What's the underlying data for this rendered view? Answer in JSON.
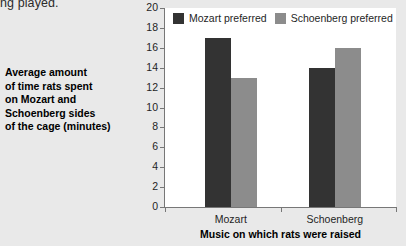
{
  "clipped_text": "ng played.",
  "y_caption_lines": [
    "Average amount",
    "of time rats spent",
    "on Mozart and",
    "Schoenberg sides",
    "of the cage (minutes)"
  ],
  "colors": {
    "series_mozart": "#333333",
    "series_schoenberg": "#8c8c8c",
    "page_background": "#e9e9e9",
    "plot_background": "#ffffff",
    "axis": "#777777"
  },
  "chart_data": {
    "type": "bar",
    "title": "",
    "xlabel": "Music on which rats were raised",
    "ylabel": "Average amount of time rats spent on Mozart and Schoenberg sides of the cage (minutes)",
    "categories": [
      "Mozart",
      "Schoenberg"
    ],
    "series": [
      {
        "name": "Mozart preferred",
        "values": [
          17,
          14
        ]
      },
      {
        "name": "Schoenberg preferred",
        "values": [
          13,
          16
        ]
      }
    ],
    "ylim": [
      0,
      20
    ],
    "ytick_step": 2,
    "yticks": [
      0,
      2,
      4,
      6,
      8,
      10,
      12,
      14,
      16,
      18,
      20
    ],
    "grid": false,
    "legend_position": "top-left-inside"
  }
}
